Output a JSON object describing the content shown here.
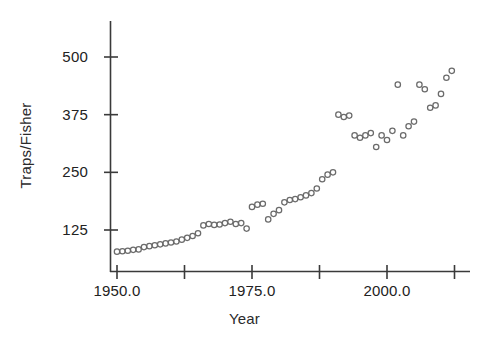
{
  "chart_data": {
    "type": "scatter",
    "title": "",
    "xlabel": "Year",
    "ylabel": "Traps/Fisher",
    "xlim": [
      1948.0,
      2014.5
    ],
    "ylim": [
      60,
      540
    ],
    "grid": false,
    "legend": null,
    "marker": "open-circle",
    "marker_color": "#6b6b6b",
    "xticks": [
      1950.0,
      1962.5,
      1975.0,
      1987.5,
      2000.0,
      2012.5
    ],
    "xtick_labels": [
      "1950.0",
      "",
      "1975.0",
      "",
      "2000.0",
      ""
    ],
    "yticks": [
      125,
      250,
      375,
      500
    ],
    "ytick_labels": [
      "125",
      "250",
      "375",
      "500"
    ],
    "x": [
      1950,
      1951,
      1952,
      1953,
      1954,
      1955,
      1956,
      1957,
      1958,
      1959,
      1960,
      1961,
      1962,
      1963,
      1964,
      1965,
      1966,
      1967,
      1968,
      1969,
      1970,
      1971,
      1972,
      1973,
      1974,
      1975,
      1976,
      1977,
      1978,
      1979,
      1980,
      1981,
      1982,
      1983,
      1984,
      1985,
      1986,
      1987,
      1988,
      1989,
      1990,
      1991,
      1992,
      1993,
      1994,
      1995,
      1996,
      1997,
      1998,
      1999,
      2000,
      2001,
      2002,
      2003,
      2004,
      2005,
      2006,
      2007,
      2008,
      2009,
      2010,
      2011,
      2012
    ],
    "y": [
      78,
      79,
      80,
      82,
      83,
      88,
      90,
      92,
      94,
      96,
      98,
      100,
      104,
      108,
      112,
      118,
      135,
      138,
      136,
      137,
      140,
      143,
      138,
      140,
      128,
      175,
      180,
      182,
      148,
      160,
      168,
      185,
      190,
      192,
      196,
      200,
      205,
      215,
      235,
      245,
      250,
      375,
      370,
      373,
      330,
      325,
      330,
      335,
      305,
      330,
      320,
      340,
      440,
      330,
      350,
      360,
      440,
      430,
      390,
      395,
      420,
      455,
      470
    ],
    "series_note": "Traps per fisher by year"
  },
  "axes": {
    "y_title": "Traps/Fisher",
    "x_title": "Year",
    "y_tick_labels": [
      "500",
      "375",
      "250",
      "125"
    ],
    "x_tick_labels": [
      "1950.0",
      "1975.0",
      "2000.0"
    ]
  }
}
